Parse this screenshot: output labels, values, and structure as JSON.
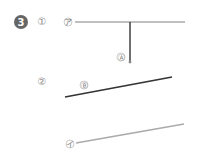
{
  "problem_number": "3",
  "parts": [
    {
      "label": "①",
      "point_label": "Ⓐ",
      "line_label": "ア"
    },
    {
      "label": "②",
      "point_label": "Ⓑ"
    },
    {
      "line_label": "イ"
    }
  ],
  "colors": {
    "badge": "#666666",
    "gray_line": "#aaaaaa",
    "dark_line": "#333333"
  }
}
